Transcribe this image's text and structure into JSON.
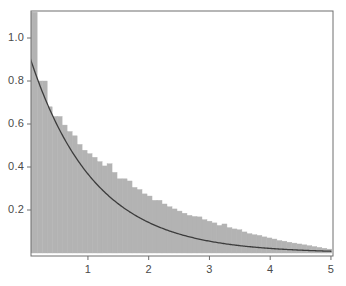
{
  "chart_data": {
    "type": "bar",
    "subtype": "histogram-with-density-curve",
    "title": "",
    "subtitle": "",
    "xlabel": "",
    "ylabel": "",
    "xlim": [
      0,
      5.05
    ],
    "ylim": [
      0,
      1.1
    ],
    "grid": false,
    "legend": null,
    "annotations": [],
    "axis": {
      "frame_color": "#6e6e6e",
      "x_ticks": [
        1,
        2,
        3,
        4,
        5
      ],
      "x_tick_labels": [
        "1",
        "2",
        "3",
        "4",
        "5"
      ],
      "y_ticks": [
        0.2,
        0.4,
        0.6,
        0.8,
        1.0
      ],
      "y_tick_labels": [
        "0.2",
        "0.4",
        "0.6",
        "0.8",
        "1.0"
      ],
      "tick_direction": "out",
      "tick_label_color": "#4a4a4a"
    },
    "series": [
      {
        "name": "histogram",
        "type": "bar",
        "color": "#b3b3b3",
        "edge_color": "#b3b3b3",
        "bin_width": 0.0822,
        "bin_start": 0.0,
        "note": "first bin is clipped by the top of the plot frame",
        "x": [
          0.041,
          0.123,
          0.205,
          0.288,
          0.37,
          0.452,
          0.534,
          0.616,
          0.699,
          0.781,
          0.863,
          0.945,
          1.027,
          1.11,
          1.192,
          1.274,
          1.356,
          1.438,
          1.521,
          1.603,
          1.685,
          1.767,
          1.849,
          1.932,
          2.014,
          2.096,
          2.178,
          2.26,
          2.343,
          2.425,
          2.507,
          2.589,
          2.671,
          2.754,
          2.836,
          2.918,
          3.0,
          3.082,
          3.165,
          3.247,
          3.329,
          3.411,
          3.493,
          3.576,
          3.658,
          3.74,
          3.822,
          3.904,
          3.987,
          4.069,
          4.151,
          4.233,
          4.315,
          4.398,
          4.48,
          4.562,
          4.644,
          4.726,
          4.809,
          4.891,
          4.973
        ],
        "values": [
          1.12,
          1.12,
          0.8,
          0.8,
          0.68,
          0.635,
          0.635,
          0.595,
          0.565,
          0.545,
          0.505,
          0.478,
          0.462,
          0.445,
          0.425,
          0.405,
          0.415,
          0.375,
          0.345,
          0.345,
          0.335,
          0.305,
          0.295,
          0.275,
          0.265,
          0.245,
          0.245,
          0.228,
          0.215,
          0.205,
          0.195,
          0.185,
          0.175,
          0.17,
          0.168,
          0.155,
          0.148,
          0.14,
          0.128,
          0.135,
          0.118,
          0.112,
          0.108,
          0.098,
          0.09,
          0.085,
          0.082,
          0.075,
          0.07,
          0.065,
          0.058,
          0.055,
          0.05,
          0.046,
          0.042,
          0.038,
          0.034,
          0.03,
          0.026,
          0.022,
          0.018
        ]
      },
      {
        "name": "density-curve",
        "type": "line",
        "color": "#3c3c3c",
        "line_width": 1.3,
        "formula": "y = 0.95 * exp(-0.95 * x)",
        "x": [
          0.0,
          0.1,
          0.2,
          0.3,
          0.4,
          0.5,
          0.6,
          0.7,
          0.8,
          0.9,
          1.0,
          1.1,
          1.2,
          1.3,
          1.4,
          1.5,
          1.6,
          1.7,
          1.8,
          1.9,
          2.0,
          2.2,
          2.4,
          2.6,
          2.8,
          3.0,
          3.2,
          3.4,
          3.6,
          3.8,
          4.0,
          4.2,
          4.4,
          4.6,
          4.8,
          5.0
        ],
        "values": [
          0.95,
          0.864,
          0.786,
          0.715,
          0.65,
          0.591,
          0.538,
          0.489,
          0.445,
          0.405,
          0.368,
          0.335,
          0.305,
          0.277,
          0.252,
          0.229,
          0.208,
          0.19,
          0.172,
          0.157,
          0.143,
          0.118,
          0.098,
          0.081,
          0.067,
          0.055,
          0.046,
          0.038,
          0.031,
          0.026,
          0.021,
          0.018,
          0.015,
          0.012,
          0.01,
          0.008
        ]
      }
    ]
  },
  "figure": {
    "background_color": "#ffffff",
    "plot_area": {
      "left": 31,
      "top": 11,
      "right": 333,
      "bottom": 256
    }
  }
}
